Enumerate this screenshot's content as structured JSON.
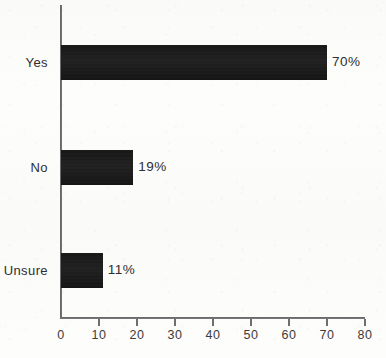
{
  "chart_data": {
    "type": "bar",
    "orientation": "horizontal",
    "title": "",
    "subtitle": "",
    "xlabel": "",
    "ylabel": "",
    "categories": [
      "Yes",
      "No",
      "Unsure"
    ],
    "values": [
      70,
      19,
      11
    ],
    "value_labels": [
      "70%",
      "19%",
      "11%"
    ],
    "unit": "%",
    "xlim": [
      0,
      80
    ],
    "x_ticks": [
      0,
      10,
      20,
      30,
      40,
      50,
      60,
      70,
      80
    ],
    "x_tick_labels": [
      "0",
      "10",
      "20",
      "30",
      "40",
      "50",
      "60",
      "70",
      "80"
    ],
    "grid": false,
    "legend": false,
    "legend_position": "none",
    "series": [
      {
        "name": "",
        "values": [
          70,
          19,
          11
        ]
      }
    ],
    "colors": {
      "bar": "#1a1a1a",
      "axis": "#6e6e70",
      "text": "#2e2e30",
      "background": "#fdfdfc"
    }
  },
  "axis": {
    "ticks": [
      {
        "label": "0",
        "value": 0
      },
      {
        "label": "10",
        "value": 10
      },
      {
        "label": "20",
        "value": 20
      },
      {
        "label": "30",
        "value": 30
      },
      {
        "label": "40",
        "value": 40
      },
      {
        "label": "50",
        "value": 50
      },
      {
        "label": "60",
        "value": 60
      },
      {
        "label": "70",
        "value": 70
      },
      {
        "label": "80",
        "value": 80
      }
    ]
  },
  "bars": [
    {
      "category": "Yes",
      "value": 70,
      "value_label": "70%"
    },
    {
      "category": "No",
      "value": 19,
      "value_label": "19%"
    },
    {
      "category": "Unsure",
      "value": 11,
      "value_label": "11%"
    }
  ]
}
